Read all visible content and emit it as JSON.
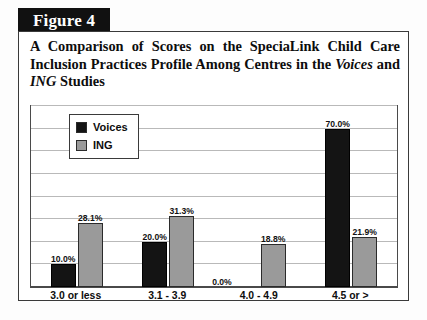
{
  "figure": {
    "tag": "Figure 4",
    "title_parts": [
      {
        "text": "A Comparison of Scores on the SpeciaLink Child Care Inclusion Practices Profile Among Centres in the ",
        "italic": false
      },
      {
        "text": "Voices",
        "italic": true
      },
      {
        "text": " and ",
        "italic": false
      },
      {
        "text": "ING",
        "italic": true
      },
      {
        "text": " Studies",
        "italic": false
      }
    ],
    "title_plain": "A Comparison of Scores on the SpeciaLink Child Care Inclusion Practices Profile Among Centres in the Voices and ING Studies"
  },
  "colors": {
    "voices": "#141414",
    "ing": "#9a9a9a",
    "frame": "#3a3a3a",
    "gridline": "#b9b9b9",
    "banner_bg": "#111111",
    "banner_text": "#ffffff"
  },
  "chart_data": {
    "type": "bar",
    "title": "A Comparison of Scores on the SpeciaLink Child Care Inclusion Practices Profile Among Centres in the Voices and ING Studies",
    "xlabel": "",
    "ylabel": "",
    "categories": [
      "3.0 or less",
      "3.1 - 3.9",
      "4.0 - 4.9",
      "4.5 or >"
    ],
    "series": [
      {
        "name": "Voices",
        "color": "#141414",
        "values": [
          10.0,
          20.0,
          0.0,
          70.0
        ],
        "labels": [
          "10.0%",
          "20.0%",
          "0.0%",
          "70.0%"
        ]
      },
      {
        "name": "ING",
        "color": "#9a9a9a",
        "values": [
          28.1,
          31.3,
          18.8,
          21.9
        ],
        "labels": [
          "28.1%",
          "31.3%",
          "18.8%",
          "21.9%"
        ]
      }
    ],
    "ylim": [
      0,
      80
    ],
    "ytick_values": [
      0,
      10,
      20,
      30,
      40,
      50,
      60,
      70,
      80
    ],
    "ytick_labels": [],
    "grid": true,
    "grid_axis": "y",
    "legend": [
      "Voices",
      "ING"
    ],
    "legend_position": "top-left-inside",
    "value_labels": true,
    "units": "percent"
  }
}
